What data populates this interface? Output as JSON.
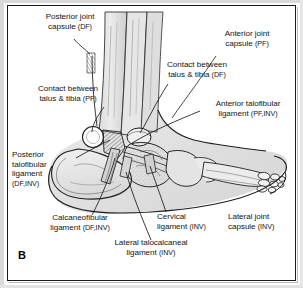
{
  "figure": {
    "panel_letter": "B",
    "caption_kind": "lateral-view ankle and foot ligament anatomy",
    "frame_color": "#1a1a1a",
    "background_color": "#ffffff",
    "ink_color": "#141414"
  },
  "labels": [
    {
      "id": "posterior-joint-capsule",
      "line1": "Posterior joint",
      "line2": "capsule",
      "qualifier": "(DF)",
      "align": "center",
      "x": 18,
      "y": 12
    },
    {
      "id": "anterior-joint-capsule",
      "line1": "Anterior joint",
      "line2": "capsule",
      "qualifier": "(PF)",
      "align": "center",
      "x": 200,
      "y": 29
    },
    {
      "id": "contact-talus-tibia-df",
      "line1": "Contact between",
      "line2": "talus & tibia",
      "qualifier": "(DF)",
      "align": "center",
      "x": 145,
      "y": 60
    },
    {
      "id": "contact-talus-tibia-pf",
      "line1": "Contact between",
      "line2": "talus & tibia",
      "qualifier": "(PF)",
      "align": "center",
      "x": 16,
      "y": 84
    },
    {
      "id": "anterior-talofibular-ligament",
      "line1": "Anterior talofibular",
      "line2": "ligament",
      "qualifier": "(PF,INV)",
      "align": "center",
      "x": 196,
      "y": 99
    },
    {
      "id": "posterior-talofibular-ligament",
      "line1": "Posterior",
      "line2": "talofibular",
      "line3": "ligament",
      "qualifier": "(DF,INV)",
      "align": "left",
      "x": 12,
      "y": 150
    },
    {
      "id": "calcaneofibular-ligament",
      "line1": "Calcaneofibular",
      "line2": "ligament",
      "qualifier": "(DF,INV)",
      "align": "center",
      "x": 26,
      "y": 213
    },
    {
      "id": "lateral-talocalcaneal-ligament",
      "line1": "Lateral talocalcaneal",
      "line2": "ligament",
      "qualifier": "(INV)",
      "align": "center",
      "x": 96,
      "y": 238
    },
    {
      "id": "cervical-ligament",
      "line1": "Cervical",
      "line2": "ligament",
      "qualifier": "(INV)",
      "align": "left",
      "x": 157,
      "y": 212
    },
    {
      "id": "lateral-joint-capsule",
      "line1": "Lateral joint",
      "line2": "capsule",
      "qualifier": "(INV)",
      "align": "left",
      "x": 228,
      "y": 212
    }
  ]
}
